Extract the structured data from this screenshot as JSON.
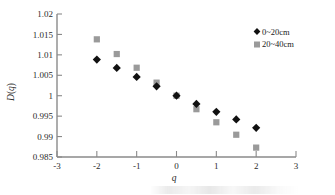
{
  "chart_data": {
    "type": "scatter",
    "title": "",
    "xlabel": "q",
    "ylabel": "D(q)",
    "xlim": [
      -3,
      3
    ],
    "ylim": [
      0.985,
      1.02
    ],
    "xticks": [
      "-3",
      "-2",
      "-1",
      "0",
      "1",
      "2",
      "3"
    ],
    "xtick_values": [
      -3,
      -2,
      -1,
      0,
      1,
      2,
      3
    ],
    "yticks": [
      "1.02",
      "1.015",
      "1.01",
      "1.005",
      "1",
      "0.995",
      "0.99",
      "0.985"
    ],
    "ytick_values": [
      1.02,
      1.015,
      1.01,
      1.005,
      1,
      0.995,
      0.99,
      0.985
    ],
    "grid": false,
    "legend_position": "top-right",
    "x": [
      -2,
      -1.5,
      -1,
      -0.5,
      0,
      0.5,
      1,
      1.5,
      2
    ],
    "series": [
      {
        "name": "0~20cm",
        "marker": "diamond",
        "color": "#111111",
        "values": [
          1.00885,
          1.0068,
          1.0046,
          1.0023,
          1.0,
          0.998,
          0.99605,
          0.9942,
          0.99215
        ]
      },
      {
        "name": "20~40cm",
        "marker": "square",
        "color": "#9a9a9a",
        "values": [
          1.0138,
          1.0102,
          1.00685,
          1.0032,
          1.0,
          0.9967,
          0.9935,
          0.99045,
          0.9873
        ]
      }
    ]
  },
  "axes": {
    "x_label": "q",
    "y_label": "D(q)"
  },
  "legend": {
    "entries": [
      {
        "label": "0~20cm",
        "marker": "diamond",
        "color": "#111111"
      },
      {
        "label": "20~40cm",
        "marker": "square",
        "color": "#9a9a9a"
      }
    ]
  },
  "colors": {
    "series_1": "#111111",
    "series_2": "#9a9a9a",
    "axis": "#808080",
    "text": "#2b2b2b",
    "background": "#ffffff"
  }
}
